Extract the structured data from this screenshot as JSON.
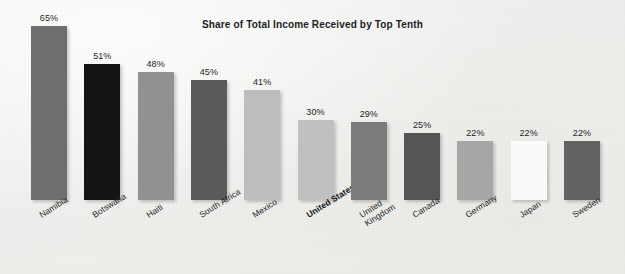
{
  "chart_data": {
    "type": "bar",
    "title": "Share of Total Income Received by Top Tenth",
    "xlabel": "",
    "ylabel": "",
    "ylim": [
      0,
      75
    ],
    "grid": false,
    "legend": "none",
    "value_suffix": "%",
    "categories": [
      "Namibia",
      "Botswana",
      "Haiti",
      "South Africa",
      "Mexico",
      "United States",
      "United Kingdom",
      "Canada",
      "Germany",
      "Japan",
      "Sweden"
    ],
    "values": [
      65,
      51,
      48,
      45,
      41,
      30,
      29,
      25,
      22,
      22,
      22
    ],
    "value_labels": [
      "65%",
      "51%",
      "48%",
      "45%",
      "41%",
      "30%",
      "29%",
      "25%",
      "22%",
      "22%",
      "22%"
    ],
    "bar_colors": [
      "#6e6e6e",
      "#141414",
      "#919191",
      "#5a5a5a",
      "#bdbdbd",
      "#c0c0c0",
      "#7c7c7c",
      "#555555",
      "#a6a6a6",
      "#fafafa",
      "#636363"
    ],
    "highlight_category": "United States",
    "label_lines": [
      [
        "Namibia"
      ],
      [
        "Botswana"
      ],
      [
        "Haiti"
      ],
      [
        "South Africa"
      ],
      [
        "Mexico"
      ],
      [
        "United States"
      ],
      [
        "United",
        "Kingdom"
      ],
      [
        "Canada"
      ],
      [
        "Germany"
      ],
      [
        "Japan"
      ],
      [
        "Sweden"
      ]
    ],
    "background_color": "#f1f1ef",
    "title_color": "#1d1d1d",
    "label_color": "#262626"
  }
}
